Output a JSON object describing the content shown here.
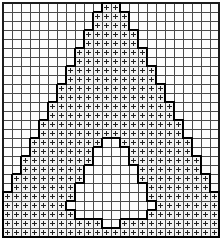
{
  "chart_data": {
    "type": "heatmap",
    "title": "",
    "xlabel": "",
    "ylabel": "",
    "columns": 24,
    "rows": 26,
    "cell_px": 9,
    "legend": [
      {
        "symbol": "+",
        "name": "marked-stitch",
        "color": "#202020"
      },
      {
        "symbol": "",
        "name": "empty-stitch",
        "color": "#fcfcfc"
      }
    ],
    "grid_color": "#4a4a4a",
    "outline_color": "#000000",
    "background_color": "#ffffff",
    "matrix": [
      [
        0,
        0,
        0,
        0,
        0,
        0,
        0,
        0,
        0,
        0,
        0,
        1,
        1,
        0,
        0,
        0,
        0,
        0,
        0,
        0,
        0,
        0,
        0,
        0
      ],
      [
        0,
        0,
        0,
        0,
        0,
        0,
        0,
        0,
        0,
        0,
        1,
        1,
        1,
        1,
        0,
        0,
        0,
        0,
        0,
        0,
        0,
        0,
        0,
        0
      ],
      [
        0,
        0,
        0,
        0,
        0,
        0,
        0,
        0,
        0,
        0,
        1,
        1,
        1,
        1,
        0,
        0,
        0,
        0,
        0,
        0,
        0,
        0,
        0,
        0
      ],
      [
        0,
        0,
        0,
        0,
        0,
        0,
        0,
        0,
        0,
        1,
        1,
        1,
        1,
        1,
        1,
        0,
        0,
        0,
        0,
        0,
        0,
        0,
        0,
        0
      ],
      [
        0,
        0,
        0,
        0,
        0,
        0,
        0,
        0,
        0,
        1,
        1,
        1,
        1,
        1,
        1,
        0,
        0,
        0,
        0,
        0,
        0,
        0,
        0,
        0
      ],
      [
        0,
        0,
        0,
        0,
        0,
        0,
        0,
        0,
        1,
        1,
        1,
        1,
        1,
        1,
        1,
        1,
        0,
        0,
        0,
        0,
        0,
        0,
        0,
        0
      ],
      [
        0,
        0,
        0,
        0,
        0,
        0,
        0,
        0,
        1,
        1,
        1,
        1,
        1,
        1,
        1,
        1,
        0,
        0,
        0,
        0,
        0,
        0,
        0,
        0
      ],
      [
        0,
        0,
        0,
        0,
        0,
        0,
        0,
        1,
        1,
        1,
        1,
        1,
        1,
        1,
        1,
        1,
        1,
        0,
        0,
        0,
        0,
        0,
        0,
        0
      ],
      [
        0,
        0,
        0,
        0,
        0,
        0,
        0,
        1,
        1,
        1,
        1,
        1,
        1,
        1,
        1,
        1,
        1,
        0,
        0,
        0,
        0,
        0,
        0,
        0
      ],
      [
        0,
        0,
        0,
        0,
        0,
        0,
        1,
        1,
        1,
        1,
        1,
        1,
        1,
        1,
        1,
        1,
        1,
        1,
        0,
        0,
        0,
        0,
        0,
        0
      ],
      [
        0,
        0,
        0,
        0,
        0,
        0,
        1,
        1,
        1,
        1,
        1,
        1,
        1,
        1,
        1,
        1,
        1,
        1,
        0,
        0,
        0,
        0,
        0,
        0
      ],
      [
        0,
        0,
        0,
        0,
        0,
        1,
        1,
        1,
        1,
        1,
        1,
        1,
        1,
        1,
        1,
        1,
        1,
        1,
        1,
        0,
        0,
        0,
        0,
        0
      ],
      [
        0,
        0,
        0,
        0,
        0,
        1,
        1,
        1,
        1,
        1,
        1,
        1,
        1,
        1,
        1,
        1,
        1,
        1,
        1,
        0,
        0,
        0,
        0,
        0
      ],
      [
        0,
        0,
        0,
        0,
        1,
        1,
        1,
        1,
        1,
        1,
        1,
        1,
        1,
        1,
        1,
        1,
        1,
        1,
        1,
        1,
        0,
        0,
        0,
        0
      ],
      [
        0,
        0,
        0,
        0,
        1,
        1,
        1,
        1,
        1,
        1,
        1,
        1,
        1,
        1,
        1,
        1,
        1,
        1,
        1,
        1,
        0,
        0,
        0,
        0
      ],
      [
        0,
        0,
        0,
        1,
        1,
        1,
        1,
        1,
        1,
        1,
        1,
        0,
        0,
        1,
        1,
        1,
        1,
        1,
        1,
        1,
        1,
        0,
        0,
        0
      ],
      [
        0,
        0,
        0,
        1,
        1,
        1,
        1,
        1,
        1,
        1,
        0,
        0,
        0,
        0,
        1,
        1,
        1,
        1,
        1,
        1,
        1,
        0,
        0,
        0
      ],
      [
        0,
        0,
        1,
        1,
        1,
        1,
        1,
        1,
        1,
        1,
        0,
        0,
        0,
        0,
        1,
        1,
        1,
        1,
        1,
        1,
        1,
        1,
        0,
        0
      ],
      [
        0,
        0,
        1,
        1,
        1,
        1,
        1,
        1,
        1,
        0,
        0,
        0,
        0,
        0,
        0,
        1,
        1,
        1,
        1,
        1,
        1,
        1,
        0,
        0
      ],
      [
        0,
        1,
        1,
        1,
        1,
        1,
        1,
        1,
        1,
        0,
        0,
        0,
        0,
        0,
        0,
        1,
        1,
        1,
        1,
        1,
        1,
        1,
        1,
        0
      ],
      [
        0,
        1,
        1,
        1,
        1,
        1,
        1,
        1,
        0,
        0,
        0,
        0,
        0,
        0,
        0,
        0,
        1,
        1,
        1,
        1,
        1,
        1,
        1,
        0
      ],
      [
        1,
        1,
        1,
        1,
        1,
        1,
        1,
        1,
        0,
        0,
        0,
        0,
        0,
        0,
        0,
        0,
        1,
        1,
        1,
        1,
        1,
        1,
        1,
        1
      ],
      [
        1,
        1,
        1,
        1,
        1,
        1,
        1,
        0,
        0,
        0,
        0,
        0,
        0,
        0,
        0,
        0,
        0,
        1,
        1,
        1,
        1,
        1,
        1,
        1
      ],
      [
        1,
        1,
        1,
        1,
        1,
        1,
        1,
        1,
        0,
        0,
        0,
        0,
        0,
        0,
        0,
        0,
        1,
        1,
        1,
        1,
        1,
        1,
        1,
        1
      ],
      [
        1,
        1,
        1,
        1,
        1,
        1,
        1,
        1,
        1,
        1,
        1,
        0,
        0,
        1,
        1,
        1,
        1,
        1,
        1,
        1,
        1,
        1,
        1,
        1
      ],
      [
        1,
        1,
        1,
        1,
        1,
        1,
        1,
        1,
        1,
        1,
        1,
        1,
        1,
        1,
        1,
        1,
        1,
        1,
        1,
        1,
        1,
        1,
        1,
        1
      ]
    ]
  }
}
